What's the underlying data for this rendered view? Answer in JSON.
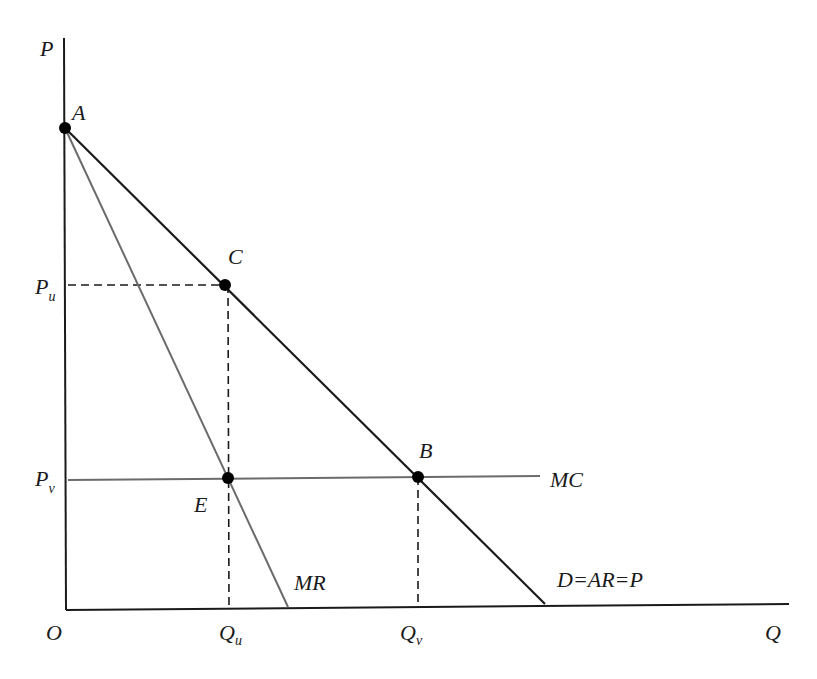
{
  "diagram": {
    "type": "monopoly-pricing-diagram",
    "colors": {
      "axis": "#1a1a1a",
      "demand": "#1a1a1a",
      "mr": "#6b6b6b",
      "mc": "#6b6b6b",
      "dashed": "#1a1a1a",
      "point": "#000000"
    },
    "axes": {
      "y_label": "P",
      "x_label": "Q",
      "origin_label": "O"
    },
    "curves": {
      "demand": "D=AR=P",
      "mr": "MR",
      "mc": "MC"
    },
    "points": {
      "a": "A",
      "b": "B",
      "c": "C",
      "e": "E"
    },
    "ticks": {
      "pu_main": "P",
      "pu_sub": "u",
      "pv_main": "P",
      "pv_sub": "v",
      "qu_main": "Q",
      "qu_sub": "u",
      "qv_main": "Q",
      "qv_sub": "v"
    }
  }
}
